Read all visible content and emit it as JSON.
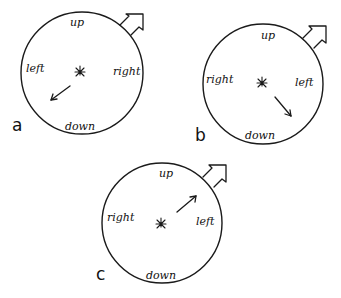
{
  "figure": {
    "panels": [
      {
        "id": "a",
        "panel_label": "a",
        "labels": {
          "top": "up",
          "left": "left",
          "right": "right",
          "bottom": "down"
        },
        "inner_arrow_direction": "down-left"
      },
      {
        "id": "b",
        "panel_label": "b",
        "labels": {
          "top": "up",
          "left": "right",
          "right": "left",
          "bottom": "down"
        },
        "inner_arrow_direction": "down-right"
      },
      {
        "id": "c",
        "panel_label": "c",
        "labels": {
          "top": "up",
          "left": "right",
          "right": "left",
          "bottom": "down"
        },
        "inner_arrow_direction": "up-right"
      }
    ],
    "colors": {
      "ink": "#1a1a1a",
      "background": "#ffffff"
    }
  }
}
